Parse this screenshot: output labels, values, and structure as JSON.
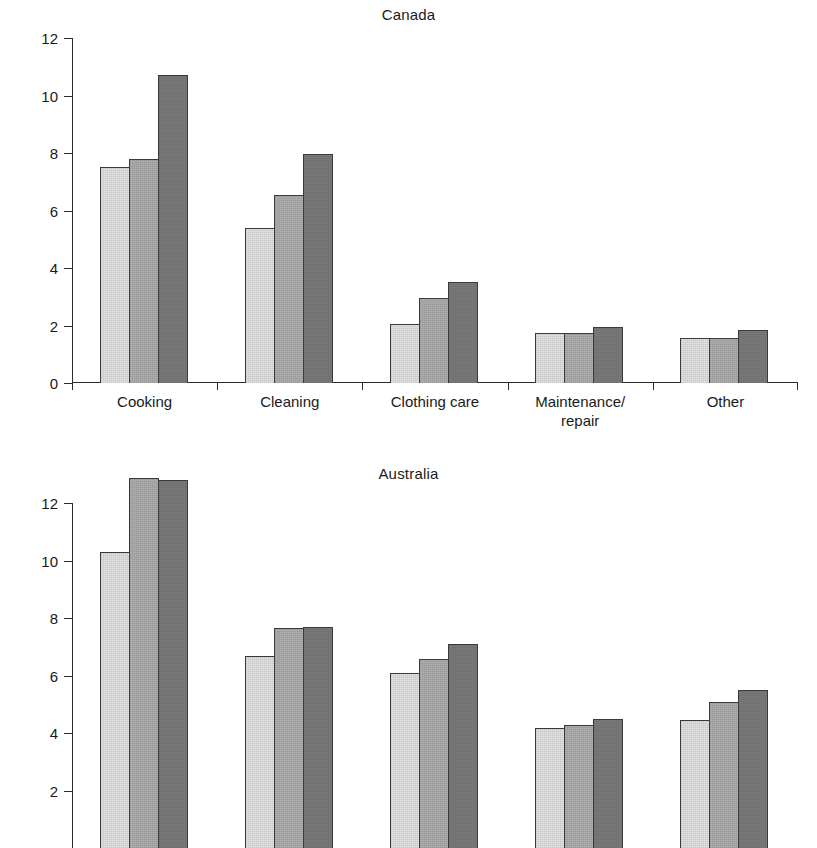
{
  "figure": {
    "background": "#ffffff",
    "series_colors": [
      "#e2e2e2",
      "#aeaeae",
      "#7b7b7b"
    ],
    "note_bottom_cropped": "Australia panel is cut off at the bottom edge of the screenshot"
  },
  "chart_data": [
    {
      "type": "bar",
      "title": "Canada",
      "xlabel": "",
      "ylabel": "",
      "ylim": [
        0,
        12
      ],
      "yticks": [
        0,
        2,
        4,
        6,
        8,
        10,
        12
      ],
      "ytick_labels": [
        "0",
        "2",
        "4",
        "6",
        "8",
        "10",
        "12"
      ],
      "grid": false,
      "legend": "none",
      "categories": [
        "Cooking",
        "Cleaning",
        "Clothing care",
        "Maintenance/ repair",
        "Other"
      ],
      "category_lines": [
        [
          "Cooking"
        ],
        [
          "Cleaning"
        ],
        [
          "Clothing care"
        ],
        [
          "Maintenance/",
          "repair"
        ],
        [
          "Other"
        ]
      ],
      "series": [
        {
          "name": "series-1",
          "values": [
            7.5,
            5.4,
            2.05,
            1.75,
            1.55
          ]
        },
        {
          "name": "series-2",
          "values": [
            7.8,
            6.55,
            2.95,
            1.75,
            1.55
          ]
        },
        {
          "name": "series-3",
          "values": [
            10.7,
            7.95,
            3.5,
            1.95,
            1.85
          ]
        }
      ]
    },
    {
      "type": "bar",
      "title": "Australia",
      "xlabel": "",
      "ylabel": "",
      "ylim": [
        0,
        12
      ],
      "yticks": [
        2,
        4,
        6,
        8,
        10,
        12
      ],
      "ytick_labels": [
        "2",
        "4",
        "6",
        "8",
        "10",
        "12"
      ],
      "grid": false,
      "legend": "none",
      "categories": [
        "Cooking",
        "Cleaning",
        "Clothing care",
        "Maintenance/ repair",
        "Other"
      ],
      "series": [
        {
          "name": "series-1",
          "values": [
            8.2,
            4.6,
            4.0,
            2.1,
            2.35
          ]
        },
        {
          "name": "series-2",
          "values": [
            10.8,
            5.55,
            4.5,
            2.2,
            3.0
          ]
        },
        {
          "name": "series-3",
          "values": [
            10.7,
            5.6,
            5.0,
            2.4,
            3.4
          ]
        }
      ]
    }
  ]
}
